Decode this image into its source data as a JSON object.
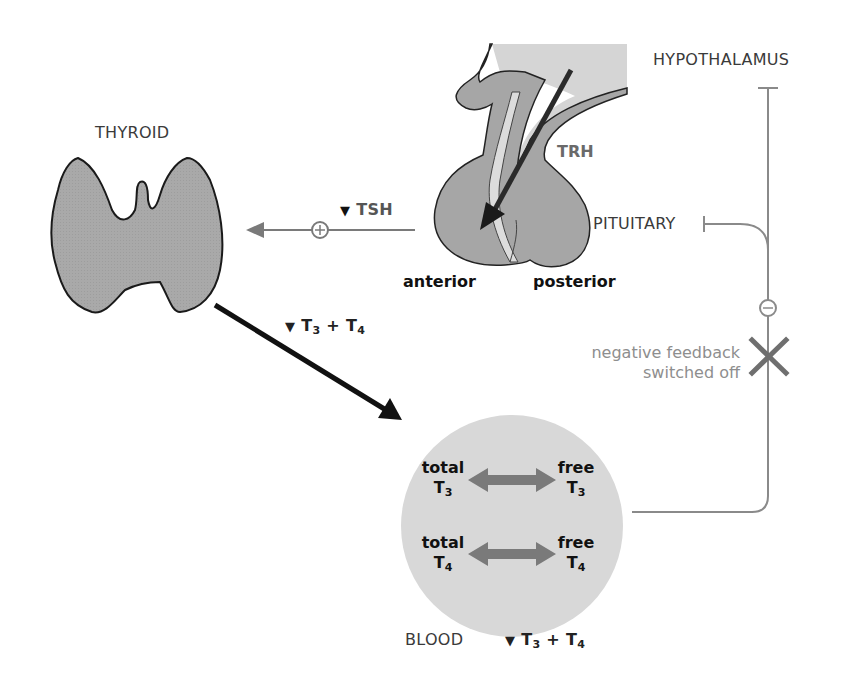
{
  "colors": {
    "organ_fill": "#a8a8a8",
    "organ_light": "#d6d6d6",
    "blood_fill": "#d9d9d9",
    "arrow_dark": "#111111",
    "arrow_gray": "#7a7a7a",
    "line_gray": "#8a8a8a",
    "label_text": "#3a3a3a"
  },
  "organs": {
    "hypothalamus": "HYPOTHALAMUS",
    "pituitary": "PITUITARY",
    "thyroid": "THYROID",
    "blood": "BLOOD"
  },
  "pituitary_parts": {
    "anterior": "anterior",
    "posterior": "posterior"
  },
  "hormones": {
    "trh": "TRH",
    "tsh": {
      "indicator": "▼",
      "label": "TSH"
    },
    "thyroid_output": {
      "indicator": "▼",
      "t": "T",
      "sub1": "3",
      "plus": " + ",
      "sub2": "4"
    },
    "blood_level": {
      "indicator": "▼",
      "t": "T",
      "sub1": "3",
      "plus": " + ",
      "sub2": "4"
    }
  },
  "blood_exchange": [
    {
      "left_top": "total",
      "left_t": "T",
      "left_sub": "3",
      "right_top": "free",
      "right_t": "T",
      "right_sub": "3"
    },
    {
      "left_top": "total",
      "left_t": "T",
      "left_sub": "4",
      "right_top": "free",
      "right_t": "T",
      "right_sub": "4"
    }
  ],
  "symbols": {
    "stimulation": "+",
    "inhibition": "−",
    "switched_off_mark": "×"
  },
  "feedback": {
    "line1": "negative feedback",
    "line2": "switched off"
  }
}
